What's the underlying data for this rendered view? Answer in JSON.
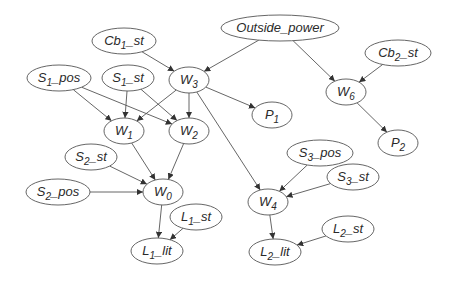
{
  "diagram": {
    "type": "directed-graph",
    "colors": {
      "stroke": "#555555",
      "fill": "#ffffff",
      "text": "#2a2a2a"
    },
    "nodes": [
      {
        "id": "Outside_power",
        "base": "Outside_power",
        "sub": "",
        "suffix": "",
        "cx": 280,
        "cy": 28,
        "rx": 59,
        "ry": 13
      },
      {
        "id": "Cb1_st",
        "base": "Cb",
        "sub": "1",
        "suffix": "_st",
        "cx": 124,
        "cy": 41,
        "rx": 32,
        "ry": 13
      },
      {
        "id": "Cb2_st",
        "base": "Cb",
        "sub": "2",
        "suffix": "_st",
        "cx": 398,
        "cy": 53,
        "rx": 33,
        "ry": 13
      },
      {
        "id": "S1_pos",
        "base": "S",
        "sub": "1",
        "suffix": "_pos",
        "cx": 59,
        "cy": 78,
        "rx": 32,
        "ry": 13
      },
      {
        "id": "S1_st",
        "base": "S",
        "sub": "1",
        "suffix": "_st",
        "cx": 128,
        "cy": 78,
        "rx": 26,
        "ry": 13
      },
      {
        "id": "W3",
        "base": "W",
        "sub": "3",
        "suffix": "",
        "cx": 189,
        "cy": 80,
        "rx": 20,
        "ry": 13
      },
      {
        "id": "W6",
        "base": "W",
        "sub": "6",
        "suffix": "",
        "cx": 346,
        "cy": 92,
        "rx": 20,
        "ry": 13
      },
      {
        "id": "P1",
        "base": "P",
        "sub": "1",
        "suffix": "",
        "cx": 272,
        "cy": 115,
        "rx": 20,
        "ry": 13
      },
      {
        "id": "W1",
        "base": "W",
        "sub": "1",
        "suffix": "",
        "cx": 124,
        "cy": 131,
        "rx": 20,
        "ry": 13
      },
      {
        "id": "W2",
        "base": "W",
        "sub": "2",
        "suffix": "",
        "cx": 189,
        "cy": 131,
        "rx": 20,
        "ry": 13
      },
      {
        "id": "P2",
        "base": "P",
        "sub": "2",
        "suffix": "",
        "cx": 398,
        "cy": 143,
        "rx": 20,
        "ry": 13
      },
      {
        "id": "S2_st",
        "base": "S",
        "sub": "2",
        "suffix": "_st",
        "cx": 91,
        "cy": 157,
        "rx": 26,
        "ry": 13
      },
      {
        "id": "S3_pos",
        "base": "S",
        "sub": "3",
        "suffix": "_pos",
        "cx": 320,
        "cy": 153,
        "rx": 33,
        "ry": 13
      },
      {
        "id": "S3_st",
        "base": "S",
        "sub": "3",
        "suffix": "_st",
        "cx": 353,
        "cy": 177,
        "rx": 26,
        "ry": 13
      },
      {
        "id": "S2_pos",
        "base": "S",
        "sub": "2",
        "suffix": "_pos",
        "cx": 58,
        "cy": 192,
        "rx": 32,
        "ry": 13
      },
      {
        "id": "W0",
        "base": "W",
        "sub": "0",
        "suffix": "",
        "cx": 163,
        "cy": 192,
        "rx": 20,
        "ry": 13
      },
      {
        "id": "W4",
        "base": "W",
        "sub": "4",
        "suffix": "",
        "cx": 268,
        "cy": 202,
        "rx": 20,
        "ry": 13
      },
      {
        "id": "L1_st",
        "base": "L",
        "sub": "1",
        "suffix": "_st",
        "cx": 196,
        "cy": 217,
        "rx": 26,
        "ry": 13
      },
      {
        "id": "L2_st",
        "base": "L",
        "sub": "2",
        "suffix": "_st",
        "cx": 348,
        "cy": 229,
        "rx": 26,
        "ry": 13
      },
      {
        "id": "L1_lit",
        "base": "L",
        "sub": "1",
        "suffix": "_lit",
        "cx": 157,
        "cy": 251,
        "rx": 26,
        "ry": 13
      },
      {
        "id": "L2_lit",
        "base": "L",
        "sub": "2",
        "suffix": "_lit",
        "cx": 275,
        "cy": 252,
        "rx": 26,
        "ry": 13
      }
    ],
    "edges": [
      [
        "Outside_power",
        "W3"
      ],
      [
        "Outside_power",
        "W6"
      ],
      [
        "Cb1_st",
        "W3"
      ],
      [
        "Cb2_st",
        "W6"
      ],
      [
        "W6",
        "P2"
      ],
      [
        "W3",
        "P1"
      ],
      [
        "W3",
        "W1"
      ],
      [
        "W3",
        "W2"
      ],
      [
        "W3",
        "W4"
      ],
      [
        "S1_pos",
        "W1"
      ],
      [
        "S1_pos",
        "W2"
      ],
      [
        "S1_st",
        "W1"
      ],
      [
        "S1_st",
        "W2"
      ],
      [
        "W1",
        "W0"
      ],
      [
        "W2",
        "W0"
      ],
      [
        "S2_st",
        "W0"
      ],
      [
        "S2_pos",
        "W0"
      ],
      [
        "W0",
        "L1_lit"
      ],
      [
        "L1_st",
        "L1_lit"
      ],
      [
        "S3_pos",
        "W4"
      ],
      [
        "S3_st",
        "W4"
      ],
      [
        "W4",
        "L2_lit"
      ],
      [
        "L2_st",
        "L2_lit"
      ]
    ]
  }
}
